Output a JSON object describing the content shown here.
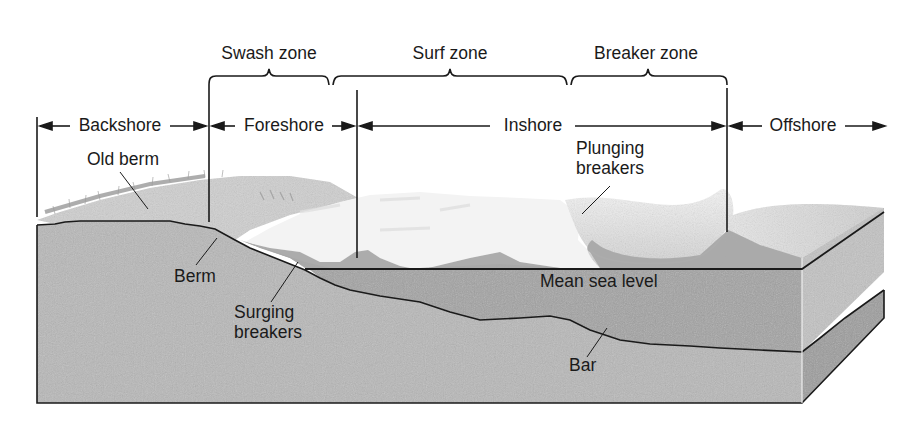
{
  "diagram": {
    "type": "beach profile cross-section",
    "zones_top": [
      {
        "id": "swash",
        "label": "Swash zone"
      },
      {
        "id": "surf",
        "label": "Surf zone"
      },
      {
        "id": "breaker",
        "label": "Breaker zone"
      }
    ],
    "regions": [
      {
        "id": "backshore",
        "label": "Backshore"
      },
      {
        "id": "foreshore",
        "label": "Foreshore"
      },
      {
        "id": "inshore",
        "label": "Inshore"
      },
      {
        "id": "offshore",
        "label": "Offshore"
      }
    ],
    "features": {
      "old_berm": "Old berm",
      "berm": "Berm",
      "surging_breakers": [
        "Surging",
        "breakers"
      ],
      "plunging_breakers": [
        "Plunging",
        "breakers"
      ],
      "mean_sea_level": "Mean sea level",
      "bar": "Bar"
    },
    "colors": {
      "sediment": "#b8b8b8",
      "water": "#a3a3a3",
      "side_face": "#c4c4c4",
      "side_sediment": "#9a9a9a",
      "foam": "#f2f2f2",
      "wave": "#dcdcdc",
      "beach_top": "#c9c9c9",
      "ink": "#1a1a1a"
    }
  }
}
